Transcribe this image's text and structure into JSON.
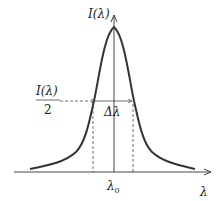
{
  "diagram": {
    "y_axis_label": "I(λ)",
    "x_axis_label": "λ",
    "center_label": "λ0",
    "half_max_label_num": "I(λ)",
    "half_max_label_den": "2",
    "width_label": "Δλ",
    "colors": {
      "curve": "#333333",
      "axis": "#444444",
      "dash": "#444444"
    }
  }
}
